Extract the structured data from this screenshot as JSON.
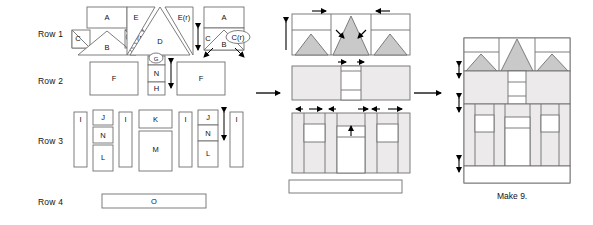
{
  "diagram": {
    "caption": "Make 9.",
    "colors": {
      "outline": "#6f6f6f",
      "outline_dark": "#4a4a4a",
      "fill_white": "#ffffff",
      "fill_light": "#eceaea",
      "fill_gray": "#c9c9c9",
      "arrow": "#000000",
      "text": "#111111"
    },
    "rows": [
      {
        "id": "row1",
        "label": "Row 1"
      },
      {
        "id": "row2",
        "label": "Row 2"
      },
      {
        "id": "row3",
        "label": "Row 3"
      },
      {
        "id": "row4",
        "label": "Row 4"
      }
    ],
    "piece_labels": {
      "a": "A",
      "b": "B",
      "c": "C",
      "c_r": "C(r)",
      "d": "D",
      "e": "E",
      "e_r": "E(r)",
      "f1": "F",
      "f2": "F",
      "g": "G",
      "h": "H",
      "i1": "I",
      "i2": "I",
      "i3": "I",
      "i4": "I",
      "j1": "J",
      "j2": "J",
      "k": "K",
      "l1": "L",
      "l2": "L",
      "m": "M",
      "n1": "N",
      "n2": "N",
      "n3": "N",
      "o": "O"
    },
    "step_arrows": [
      {
        "id": "arrow-to-middle"
      },
      {
        "id": "arrow-to-final"
      }
    ]
  }
}
